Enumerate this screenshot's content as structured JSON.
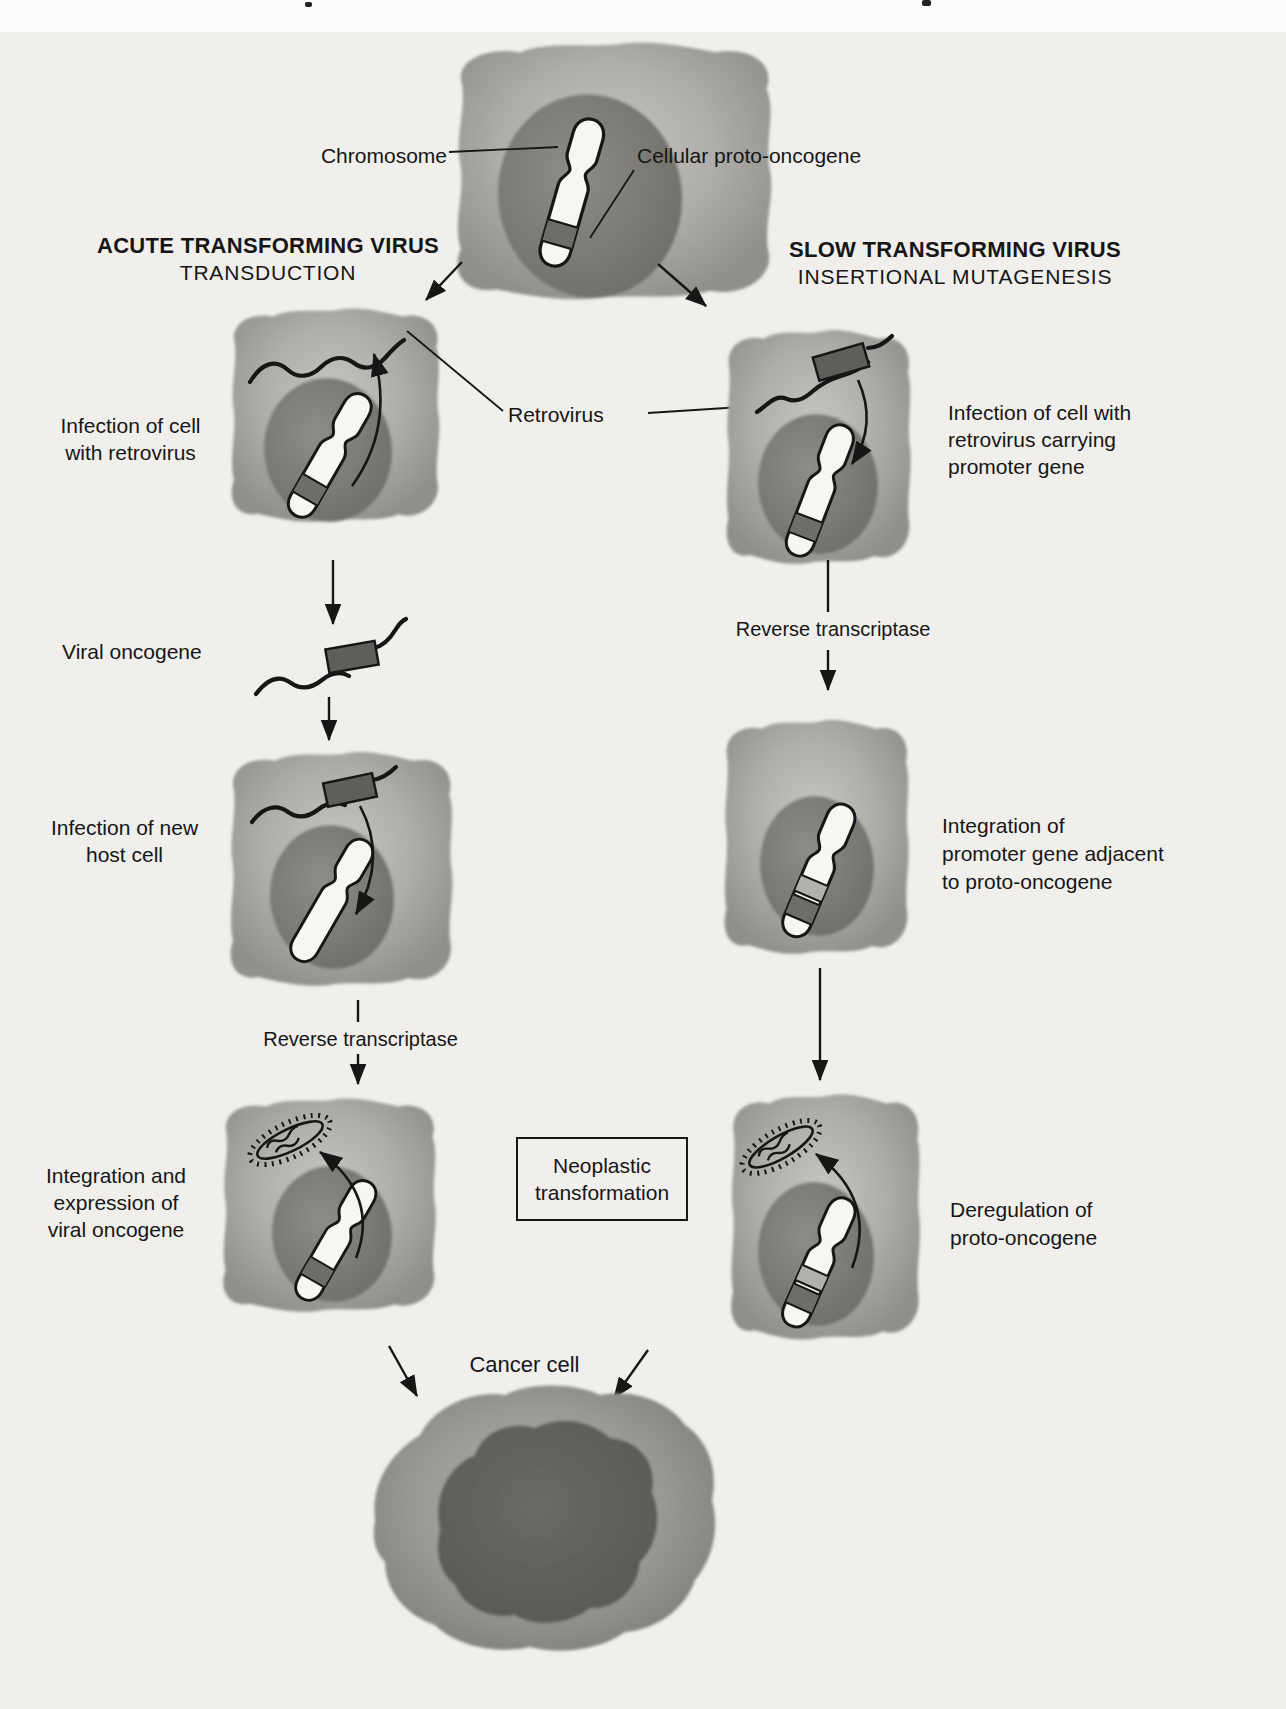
{
  "figure": {
    "top_labels": {
      "chromosome": "Chromosome",
      "cellular_proto_oncogene": "Cellular proto-oncogene",
      "retrovirus": "Retrovirus"
    },
    "left_branch": {
      "title": "ACUTE TRANSFORMING VIRUS",
      "subtitle": "TRANSDUCTION",
      "step_infection": [
        "Infection of cell",
        "with retrovirus"
      ],
      "viral_oncogene": "Viral oncogene",
      "step_new_host": [
        "Infection of new",
        "host cell"
      ],
      "reverse_transcriptase": "Reverse transcriptase",
      "step_integration": [
        "Integration and",
        "expression of",
        "viral oncogene"
      ]
    },
    "right_branch": {
      "title": "SLOW TRANSFORMING VIRUS",
      "subtitle": "INSERTIONAL MUTAGENESIS",
      "step_infection": [
        "Infection of cell with",
        "retrovirus carrying",
        "promoter gene"
      ],
      "reverse_transcriptase": "Reverse transcriptase",
      "step_integration": [
        "Integration of",
        "promoter gene adjacent",
        "to proto-oncogene"
      ],
      "step_deregulation": [
        "Deregulation of",
        "proto-oncogene"
      ]
    },
    "outcome": {
      "neoplastic_box": [
        "Neoplastic",
        "transformation"
      ],
      "cancer_cell": "Cancer cell"
    },
    "colors": {
      "page_background": "#f1efec",
      "cell_cytoplasm": "#a8a7a3",
      "cell_nucleus": "#787672",
      "chromosome_fill": "#f8f6f1",
      "oncogene_band": "#6e6d69",
      "promoter_band": "#b2b1ad",
      "cancer_cytoplasm": "#96958f",
      "cancer_nucleus": "#5d5c58",
      "ink": "#161616"
    }
  }
}
